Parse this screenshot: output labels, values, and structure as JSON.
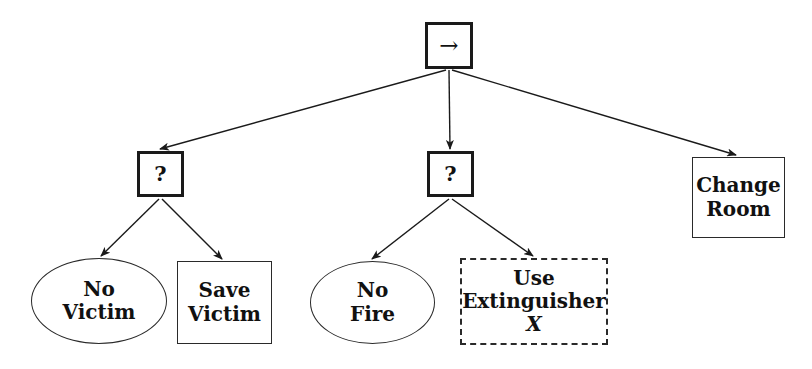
{
  "diagram": {
    "type": "behaviour-tree",
    "background_color": "#ffffff",
    "stroke_color": "#1a1a1a",
    "text_color": "#111111",
    "nodes": [
      {
        "id": "root",
        "label": "→",
        "icon": "right-arrow-icon",
        "shape": "square",
        "style": "thick-border",
        "x": 425,
        "y": 22,
        "w": 48,
        "h": 47
      },
      {
        "id": "decision-victim",
        "label": "?",
        "shape": "square",
        "style": "thick-border",
        "x": 137,
        "y": 151,
        "w": 47,
        "h": 46
      },
      {
        "id": "decision-fire",
        "label": "?",
        "shape": "square",
        "style": "thick-border",
        "x": 427,
        "y": 151,
        "w": 47,
        "h": 46
      },
      {
        "id": "change-room",
        "label": "Change\nRoom",
        "shape": "rect",
        "style": "thin-border",
        "x": 692,
        "y": 157,
        "w": 93,
        "h": 81
      },
      {
        "id": "no-victim",
        "label": "No\nVictim",
        "shape": "ellipse",
        "style": "thin-border",
        "x": 31,
        "y": 258,
        "w": 136,
        "h": 86
      },
      {
        "id": "save-victim",
        "label": "Save\nVictim",
        "shape": "rect",
        "style": "thin-border",
        "x": 177,
        "y": 261,
        "w": 95,
        "h": 83
      },
      {
        "id": "no-fire",
        "label": "No\nFire",
        "shape": "ellipse",
        "style": "thin-border",
        "x": 310,
        "y": 261,
        "w": 125,
        "h": 83
      },
      {
        "id": "use-extinguisher",
        "label": "Use\nExtinguisher",
        "label_math": "X",
        "shape": "rect",
        "style": "dashed-border",
        "x": 460,
        "y": 258,
        "w": 148,
        "h": 87
      }
    ],
    "edges": [
      {
        "from": "root",
        "to": "decision-victim",
        "x1": 446,
        "y1": 70,
        "x2": 160,
        "y2": 149
      },
      {
        "from": "root",
        "to": "decision-fire",
        "x1": 449,
        "y1": 70,
        "x2": 450,
        "y2": 149
      },
      {
        "from": "root",
        "to": "change-room",
        "x1": 452,
        "y1": 70,
        "x2": 736,
        "y2": 155
      },
      {
        "from": "decision-victim",
        "to": "no-victim",
        "x1": 159,
        "y1": 199,
        "x2": 101,
        "y2": 256
      },
      {
        "from": "decision-victim",
        "to": "save-victim",
        "x1": 162,
        "y1": 199,
        "x2": 222,
        "y2": 259
      },
      {
        "from": "decision-fire",
        "to": "no-fire",
        "x1": 449,
        "y1": 199,
        "x2": 372,
        "y2": 259
      },
      {
        "from": "decision-fire",
        "to": "use-extinguisher",
        "x1": 452,
        "y1": 199,
        "x2": 533,
        "y2": 256
      }
    ]
  }
}
